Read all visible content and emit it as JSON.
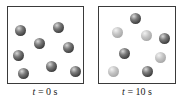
{
  "panels": [
    {
      "label_var": "t",
      "label_rest": " = 0 s",
      "spheres": [
        {
          "x": 20,
          "y": 30,
          "shade": "dark"
        },
        {
          "x": 58,
          "y": 27,
          "shade": "dark"
        },
        {
          "x": 39,
          "y": 43,
          "shade": "dark"
        },
        {
          "x": 68,
          "y": 47,
          "shade": "dark"
        },
        {
          "x": 18,
          "y": 55,
          "shade": "dark"
        },
        {
          "x": 23,
          "y": 73,
          "shade": "dark"
        },
        {
          "x": 51,
          "y": 66,
          "shade": "dark"
        },
        {
          "x": 75,
          "y": 71,
          "shade": "dark"
        }
      ]
    },
    {
      "label_var": "t",
      "label_rest": " = 10 s",
      "spheres": [
        {
          "x": 135,
          "y": 18,
          "shade": "dark"
        },
        {
          "x": 117,
          "y": 32,
          "shade": "light"
        },
        {
          "x": 146,
          "y": 35,
          "shade": "light"
        },
        {
          "x": 164,
          "y": 38,
          "shade": "dark"
        },
        {
          "x": 124,
          "y": 53,
          "shade": "dark"
        },
        {
          "x": 160,
          "y": 57,
          "shade": "light"
        },
        {
          "x": 113,
          "y": 71,
          "shade": "light"
        },
        {
          "x": 147,
          "y": 71,
          "shade": "dark"
        }
      ]
    }
  ],
  "colors": {
    "dark_sphere": "#3c3c3c",
    "light_sphere": "#b4b4b4",
    "border": "#3a3a3a"
  }
}
